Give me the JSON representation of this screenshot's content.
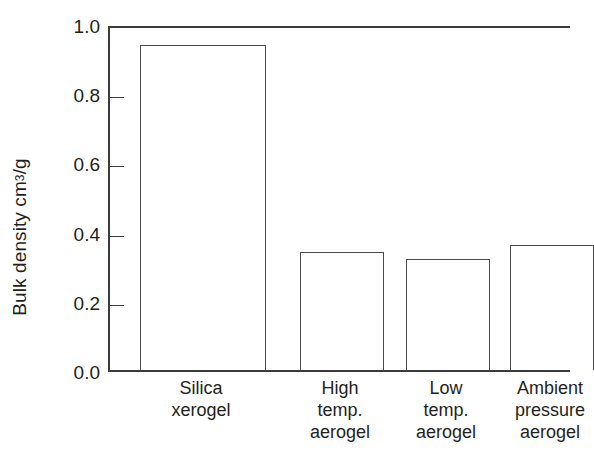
{
  "chart_data": {
    "type": "bar",
    "title": "",
    "xlabel": "",
    "ylabel": "Bulk density cm3/g",
    "ylabel_prefix": "Bulk density cm",
    "ylabel_superscript": "3",
    "ylabel_suffix": "/g",
    "ylim": [
      0.0,
      1.0
    ],
    "ytick_values": [
      0.0,
      0.2,
      0.4,
      0.6,
      0.8,
      1.0
    ],
    "ytick_labels": [
      "0.0",
      "0.2",
      "0.4",
      "0.6",
      "0.8",
      "1.0"
    ],
    "grid": false,
    "legend": false,
    "categories": [
      "Silica xerogel",
      "High temp. aerogel",
      "Low temp. aerogel",
      "Ambient pressure aerogel"
    ],
    "category_label_lines": [
      [
        "Silica",
        "xerogel"
      ],
      [
        "High",
        "temp.",
        "aerogel"
      ],
      [
        "Low",
        "temp.",
        "aerogel"
      ],
      [
        "Ambient",
        "pressure",
        "aerogel"
      ]
    ],
    "values": [
      0.94,
      0.34,
      0.32,
      0.36
    ],
    "bar_fill_color": "#ffffff",
    "bar_edge_color": "#4a4a4a",
    "axis_color": "#3b3b3b",
    "background_color": "#ffffff"
  }
}
